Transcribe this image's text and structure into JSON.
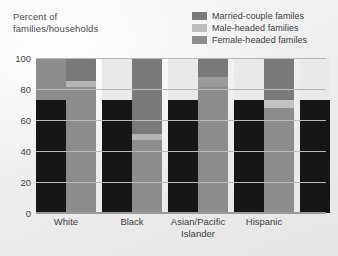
{
  "figure": {
    "background": "#eeeeee",
    "axis_title": "Percent of\nfamilies/households"
  },
  "legend": {
    "position": "top-right",
    "items": [
      {
        "label": "Married-couple familes",
        "color": "#7a7a7a",
        "icon": "legend-swatch-icon"
      },
      {
        "label": "Male-headed families",
        "color": "#bdbdbd",
        "icon": "legend-swatch-icon"
      },
      {
        "label": "Female-headed familes",
        "color": "#8d8d8d",
        "icon": "legend-swatch-icon"
      }
    ]
  },
  "chart_data": {
    "type": "bar",
    "title": "",
    "subtitle": "",
    "xlabel": "",
    "ylabel": "Percent of families/households",
    "ylim": [
      0,
      100
    ],
    "yticks": [
      0,
      20,
      40,
      60,
      80,
      100
    ],
    "grid": true,
    "stacked": true,
    "legend_position": "top-right",
    "categories": [
      "White",
      "Black",
      "Asian/Pacific\nIslander",
      "Hispanic"
    ],
    "category_labels": [
      "White",
      "Black",
      "Asian/ Pacific Islander",
      "Hispanic"
    ],
    "series": [
      {
        "name": "Married-couple familes",
        "color": "#7a7a7a",
        "values": [
          81.5,
          47.5,
          81.5,
          69.5
        ]
      },
      {
        "name": "Male-headed families",
        "color": "#bdbdbd",
        "values": [
          4.0,
          4.0,
          6.5,
          4.0
        ]
      },
      {
        "name": "Female-headed familes",
        "color": "#8d8d8d",
        "values": [
          14.5,
          48.5,
          12.0,
          26.5
        ]
      }
    ],
    "bars_per_group": 2,
    "bar_variants": [
      "families",
      "households"
    ],
    "bar_data": [
      {
        "category": "White",
        "bars": [
          {
            "variant": "families",
            "segments": [
              {
                "series": "Married-couple familes",
                "from": 0,
                "to": 73.0,
                "color": "#161616"
              },
              {
                "series": "Female-headed familes",
                "from": 73.0,
                "to": 100.0,
                "color": "#8d8d8d"
              }
            ]
          },
          {
            "variant": "households",
            "segments": [
              {
                "series": "Married-couple familes",
                "from": 0,
                "to": 81.0,
                "color": "#8d8d8d"
              },
              {
                "series": "Male-headed families",
                "from": 81.0,
                "to": 85.0,
                "color": "#b4b4b4"
              },
              {
                "series": "Female-headed familes",
                "from": 85.0,
                "to": 100.0,
                "color": "#7a7a7a"
              }
            ]
          }
        ]
      },
      {
        "category": "Black",
        "bars": [
          {
            "variant": "families",
            "segments": [
              {
                "series": "Married-couple familes",
                "from": 0,
                "to": 73.0,
                "color": "#161616"
              },
              {
                "series": "Female-headed familes",
                "from": 73.0,
                "to": 100.0,
                "color": "#e9e9e9"
              }
            ]
          },
          {
            "variant": "households",
            "segments": [
              {
                "series": "Married-couple familes",
                "from": 0,
                "to": 47.0,
                "color": "#8d8d8d"
              },
              {
                "series": "Male-headed families",
                "from": 47.0,
                "to": 51.0,
                "color": "#b4b4b4"
              },
              {
                "series": "Female-headed familes",
                "from": 51.0,
                "to": 100.0,
                "color": "#7a7a7a"
              }
            ]
          }
        ]
      },
      {
        "category": "Asian/Pacific Islander",
        "bars": [
          {
            "variant": "families",
            "segments": [
              {
                "series": "Married-couple familes",
                "from": 0,
                "to": 73.0,
                "color": "#161616"
              },
              {
                "series": "Female-headed familes",
                "from": 73.0,
                "to": 100.0,
                "color": "#e9e9e9"
              }
            ]
          },
          {
            "variant": "households",
            "segments": [
              {
                "series": "Married-couple familes",
                "from": 0,
                "to": 81.0,
                "color": "#8d8d8d"
              },
              {
                "series": "Male-headed families",
                "from": 81.0,
                "to": 88.0,
                "color": "#9a9a9a"
              },
              {
                "series": "Female-headed familes",
                "from": 88.0,
                "to": 100.0,
                "color": "#7a7a7a"
              }
            ]
          }
        ]
      },
      {
        "category": "Hispanic",
        "bars": [
          {
            "variant": "families",
            "segments": [
              {
                "series": "Married-couple familes",
                "from": 0,
                "to": 73.0,
                "color": "#161616"
              },
              {
                "series": "Female-headed familes",
                "from": 73.0,
                "to": 100.0,
                "color": "#e9e9e9"
              }
            ]
          },
          {
            "variant": "households",
            "segments": [
              {
                "series": "Married-couple familes",
                "from": 0,
                "to": 68.0,
                "color": "#8d8d8d"
              },
              {
                "series": "Male-headed families",
                "from": 68.0,
                "to": 73.0,
                "color": "#c2c2c2"
              },
              {
                "series": "Female-headed familes",
                "from": 73.0,
                "to": 100.0,
                "color": "#7a7a7a"
              }
            ]
          }
        ]
      }
    ],
    "trailing_bar": {
      "segments": [
        {
          "from": 0,
          "to": 73.0,
          "color": "#161616"
        },
        {
          "from": 73.0,
          "to": 100.0,
          "color": "#e9e9e9"
        }
      ]
    }
  }
}
